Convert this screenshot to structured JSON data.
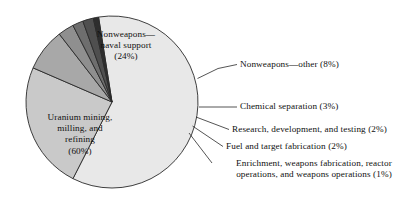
{
  "chart_data": {
    "type": "pie",
    "title": "",
    "subtitle": "",
    "xlabel": "",
    "ylabel": "",
    "legend_position": "none",
    "grid": false,
    "total_percent": 100,
    "categories": [
      "Uranium mining, milling, and refining",
      "Nonweapons—naval support",
      "Nonweapons—other",
      "Chemical separation",
      "Research, development, and testing",
      "Fuel and target fabrication",
      "Enrichment, weapons fabrication, reactor operations, and weapons operations"
    ],
    "values": [
      60,
      24,
      8,
      3,
      2,
      2,
      1
    ],
    "labels_on_slice": [
      {
        "text": "Nonweapons—\nnaval support\n(24%)",
        "value": 24
      },
      {
        "text": "Uranium mining,\nmilling, and\nrefining\n(60%)",
        "value": 60
      }
    ],
    "callouts": [
      {
        "text": "Nonweapons—other (8%)",
        "value": 8
      },
      {
        "text": "Chemical separation (3%)",
        "value": 3
      },
      {
        "text": "Research, development, and testing (2%)",
        "value": 2
      },
      {
        "text": "Fuel and target fabrication (2%)",
        "value": 2
      },
      {
        "text": "Enrichment, weapons fabrication, reactor\noperations, and weapons operations (1%)",
        "value": 1
      }
    ],
    "slice_colors": [
      "#e8e8e8",
      "#c9c9c9",
      "#a8a8a8",
      "#8f8f8f",
      "#6e6e6e",
      "#4f4f4f",
      "#2e2e2e"
    ],
    "outline_color": "#2a2a2a",
    "background_color": "#ffffff"
  },
  "geometry": {
    "center_x": 112,
    "center_y": 102,
    "radius": 86
  }
}
